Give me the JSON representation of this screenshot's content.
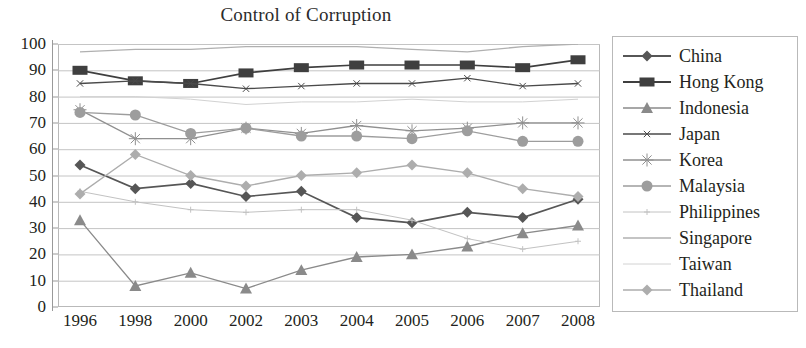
{
  "chart_data": {
    "type": "line",
    "title": "Control of Corruption",
    "xlabel": "",
    "ylabel": "",
    "ylim": [
      0,
      100
    ],
    "ytick_step": 10,
    "grid": true,
    "legend_position": "right",
    "categories": [
      "1996",
      "1998",
      "2000",
      "2002",
      "2003",
      "2004",
      "2005",
      "2006",
      "2007",
      "2008"
    ],
    "yticks": [
      "100",
      "90",
      "80",
      "70",
      "60",
      "50",
      "40",
      "30",
      "20",
      "10",
      "0"
    ],
    "series": [
      {
        "name": "China",
        "marker": "diamond",
        "color": "#565656",
        "values": [
          54,
          45,
          47,
          42,
          44,
          34,
          32,
          36,
          34,
          41
        ]
      },
      {
        "name": "Hong Kong",
        "marker": "square",
        "color": "#3f3f3f",
        "values": [
          90,
          86,
          85,
          89,
          91,
          92,
          92,
          92,
          91,
          94
        ]
      },
      {
        "name": "Indonesia",
        "marker": "triangle",
        "color": "#8a8a8a",
        "values": [
          33,
          8,
          13,
          7,
          14,
          19,
          20,
          23,
          28,
          31
        ]
      },
      {
        "name": "Japan",
        "marker": "thin-x",
        "color": "#4a4a4a",
        "values": [
          85,
          86,
          85,
          83,
          84,
          85,
          85,
          87,
          84,
          85
        ]
      },
      {
        "name": "Korea",
        "marker": "asterisk",
        "color": "#909090",
        "values": [
          75,
          64,
          64,
          68,
          66,
          69,
          67,
          68,
          70,
          70
        ]
      },
      {
        "name": "Malaysia",
        "marker": "circle",
        "color": "#9d9d9d",
        "values": [
          74,
          73,
          66,
          68,
          65,
          65,
          64,
          67,
          63,
          63
        ]
      },
      {
        "name": "Philippines",
        "marker": "plus-line",
        "color": "#c2c2c2",
        "values": [
          44,
          40,
          37,
          36,
          37,
          37,
          33,
          26,
          22,
          25
        ]
      },
      {
        "name": "Singapore",
        "marker": "line",
        "color": "#b0b0b0",
        "values": [
          97,
          98,
          98,
          99,
          99,
          99,
          98,
          97,
          99,
          100
        ]
      },
      {
        "name": "Taiwan",
        "marker": "faint-line",
        "color": "#d2d2d2",
        "values": [
          80,
          80,
          79,
          77,
          78,
          78,
          79,
          78,
          78,
          79
        ]
      },
      {
        "name": "Thailand",
        "marker": "light-diamond",
        "color": "#adadad",
        "values": [
          43,
          58,
          50,
          46,
          50,
          51,
          54,
          51,
          45,
          42
        ]
      }
    ]
  }
}
